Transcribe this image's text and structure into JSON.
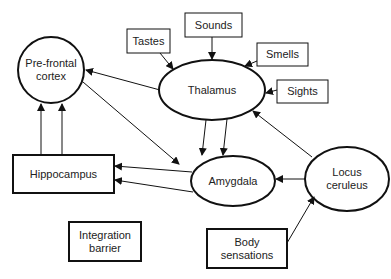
{
  "diagram": {
    "nodes": {
      "tastes": {
        "label": "Tastes",
        "shape": "box"
      },
      "sounds": {
        "label": "Sounds",
        "shape": "box"
      },
      "smells": {
        "label": "Smells",
        "shape": "box"
      },
      "sights": {
        "label": "Sights",
        "shape": "box"
      },
      "thalamus": {
        "label": "Thalamus",
        "shape": "ellipse"
      },
      "prefrontal": {
        "label_line1": "Pre-frontal",
        "label_line2": "cortex",
        "shape": "circle"
      },
      "hippocampus": {
        "label": "Hippocampus",
        "shape": "box"
      },
      "amygdala": {
        "label": "Amygdala",
        "shape": "ellipse"
      },
      "locus": {
        "label_line1": "Locus",
        "label_line2": "ceruleus",
        "shape": "ellipse"
      },
      "integration": {
        "label_line1": "Integration",
        "label_line2": "barrier",
        "shape": "box"
      },
      "body": {
        "label_line1": "Body",
        "label_line2": "sensations",
        "shape": "box"
      }
    },
    "edges": [
      {
        "from": "Tastes",
        "to": "Thalamus"
      },
      {
        "from": "Sounds",
        "to": "Thalamus"
      },
      {
        "from": "Smells",
        "to": "Thalamus"
      },
      {
        "from": "Sights",
        "to": "Thalamus"
      },
      {
        "from": "Thalamus",
        "to": "Pre-frontal cortex"
      },
      {
        "from": "Thalamus",
        "to": "Amygdala"
      },
      {
        "from": "Thalamus",
        "to": "Amygdala"
      },
      {
        "from": "Pre-frontal cortex",
        "to": "Amygdala"
      },
      {
        "from": "Hippocampus",
        "to": "Pre-frontal cortex"
      },
      {
        "from": "Hippocampus",
        "to": "Pre-frontal cortex"
      },
      {
        "from": "Amygdala",
        "to": "Hippocampus"
      },
      {
        "from": "Amygdala",
        "to": "Hippocampus"
      },
      {
        "from": "Locus ceruleus",
        "to": "Amygdala"
      },
      {
        "from": "Locus ceruleus",
        "to": "Thalamus"
      },
      {
        "from": "Body sensations",
        "to": "Locus ceruleus"
      }
    ],
    "colors": {
      "stroke": "#111111",
      "text": "#222222",
      "background": "#ffffff"
    }
  }
}
